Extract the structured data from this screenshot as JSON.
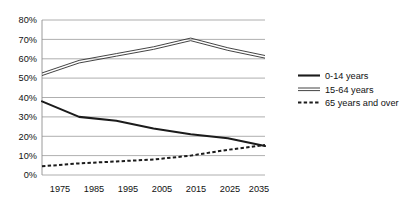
{
  "chart_data": {
    "type": "line",
    "title": "",
    "xlabel": "",
    "ylabel": "",
    "x": [
      1975,
      1985,
      1995,
      2005,
      2015,
      2025,
      2035
    ],
    "xtick_labels": [
      "1975",
      "1985",
      "1995",
      "2005",
      "2015",
      "2025",
      "2035"
    ],
    "ytick_labels": [
      "0%",
      "10%",
      "20%",
      "30%",
      "40%",
      "50%",
      "60%",
      "70%",
      "80%"
    ],
    "ytick_values": [
      0,
      10,
      20,
      30,
      40,
      50,
      60,
      70,
      80
    ],
    "ylim": [
      0,
      80
    ],
    "xlim": [
      1975,
      2035
    ],
    "grid": "horizontal",
    "legend_position": "right",
    "series": [
      {
        "name": "0-14 years",
        "style": "solid",
        "color": "#1b1b1b",
        "values": [
          38,
          30,
          28,
          24,
          21,
          19,
          15
        ]
      },
      {
        "name": "15-64 years",
        "style": "double-line",
        "color": "#3a3a3a",
        "values": [
          52,
          58.5,
          62,
          65.5,
          70,
          65,
          61
        ]
      },
      {
        "name": "65 years and over",
        "style": "dashed",
        "color": "#1b1b1b",
        "values": [
          4.5,
          6,
          7,
          8,
          10,
          13,
          15.5
        ]
      }
    ]
  },
  "legend": {
    "items": [
      {
        "label": "0-14 years"
      },
      {
        "label": "15-64 years"
      },
      {
        "label": "65 years and over"
      }
    ]
  },
  "colors": {
    "gridline": "#9a9a9a",
    "axis": "#8e8e8e",
    "text": "#111111",
    "background": "#ffffff"
  }
}
